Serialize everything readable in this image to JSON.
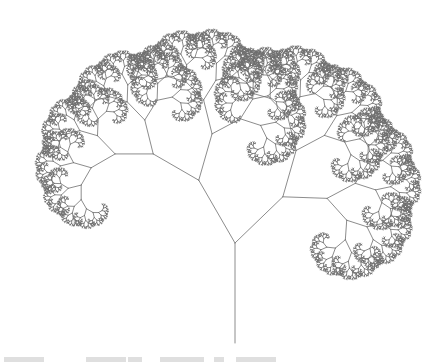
{
  "figure": {
    "canvas": {
      "width": 439,
      "height": 362,
      "background": "#ffffff"
    },
    "line_color": "#6f6f6f",
    "line_width": 0.8,
    "trunk": {
      "base_x": 235,
      "base_y": 343,
      "length": 100,
      "angle_deg": 90
    },
    "branching": {
      "left_turn_deg": 30,
      "left_ratio": 0.725,
      "right_turn_deg": 46,
      "right_ratio": 0.665,
      "max_depth": 15,
      "min_length": 1.2
    }
  },
  "caption": {
    "visible": "clipped",
    "segments": [
      {
        "x": 4,
        "w": 40
      },
      {
        "x": 86,
        "w": 40
      },
      {
        "x": 128,
        "w": 14
      },
      {
        "x": 160,
        "w": 44
      },
      {
        "x": 214,
        "w": 10
      },
      {
        "x": 236,
        "w": 40
      }
    ]
  }
}
